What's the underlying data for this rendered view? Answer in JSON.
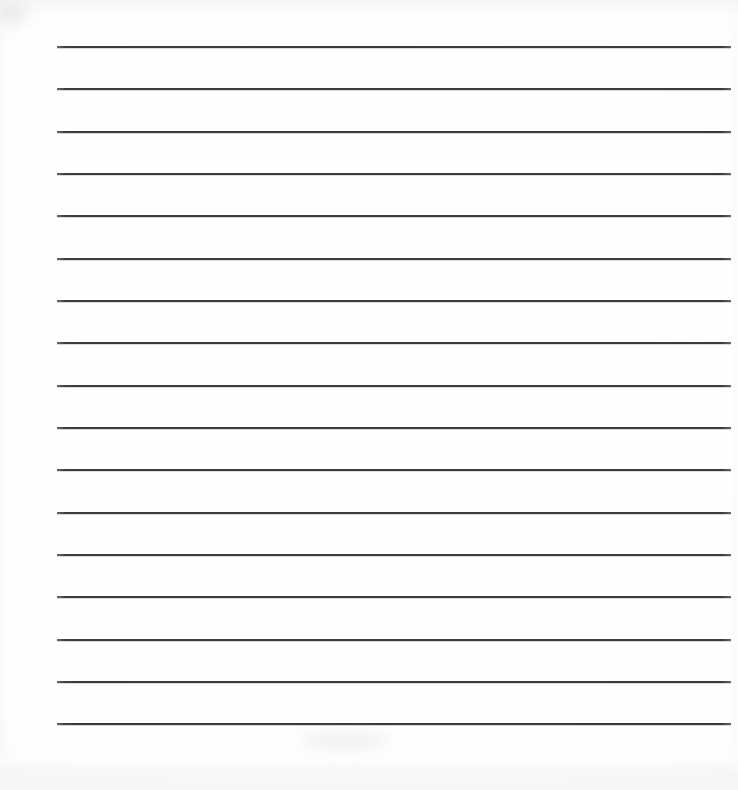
{
  "document": {
    "kind": "lined-paper-scan",
    "title": "Blank lined writing sheet",
    "page_width": 738,
    "page_height": 790,
    "background_color": "#ffffff",
    "has_text": false,
    "has_margin_line": false,
    "has_punch_holes": false,
    "has_header": false
  },
  "ruling": {
    "line_count": 17,
    "line_color": "#3c3c3c",
    "line_thickness_px": 2,
    "line_left_px": 57,
    "line_right_px": 731,
    "line_width_px": 674,
    "first_line_y_px": 46,
    "last_line_y_px": 723,
    "line_spacing_px": 42.3,
    "orientation": "horizontal",
    "lines": [
      {
        "index": 1,
        "y": 46,
        "x1": 57,
        "x2": 731
      },
      {
        "index": 2,
        "y": 88,
        "x1": 57,
        "x2": 731
      },
      {
        "index": 3,
        "y": 131,
        "x1": 57,
        "x2": 731
      },
      {
        "index": 4,
        "y": 173,
        "x1": 57,
        "x2": 731
      },
      {
        "index": 5,
        "y": 215,
        "x1": 57,
        "x2": 731
      },
      {
        "index": 6,
        "y": 258,
        "x1": 57,
        "x2": 731
      },
      {
        "index": 7,
        "y": 300,
        "x1": 57,
        "x2": 731
      },
      {
        "index": 8,
        "y": 342,
        "x1": 57,
        "x2": 731
      },
      {
        "index": 9,
        "y": 385,
        "x1": 57,
        "x2": 731
      },
      {
        "index": 10,
        "y": 427,
        "x1": 57,
        "x2": 731
      },
      {
        "index": 11,
        "y": 469,
        "x1": 57,
        "x2": 731
      },
      {
        "index": 12,
        "y": 512,
        "x1": 57,
        "x2": 731
      },
      {
        "index": 13,
        "y": 554,
        "x1": 57,
        "x2": 731
      },
      {
        "index": 14,
        "y": 596,
        "x1": 57,
        "x2": 731
      },
      {
        "index": 15,
        "y": 639,
        "x1": 57,
        "x2": 731
      },
      {
        "index": 16,
        "y": 681,
        "x1": 57,
        "x2": 731
      },
      {
        "index": 17,
        "y": 723,
        "x1": 57,
        "x2": 731
      }
    ]
  },
  "writing_lines": {
    "content": [
      "",
      "",
      "",
      "",
      "",
      "",
      "",
      "",
      "",
      "",
      "",
      "",
      "",
      "",
      "",
      "",
      ""
    ]
  }
}
